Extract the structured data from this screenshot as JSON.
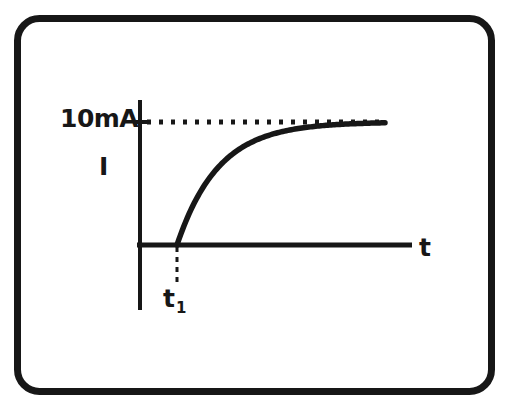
{
  "figure": {
    "border": {
      "name": "rounded-rectangle-frame",
      "color": "#171717",
      "thickness_px": 7,
      "corner_radius_px": 22,
      "x": 14,
      "y": 15,
      "width": 481,
      "height": 380
    },
    "background_color": "#ffffff",
    "ink_color": "#171717"
  },
  "labels": {
    "y_value": "10mA",
    "y_quantity": "I",
    "x_axis": "t",
    "event_time_base": "t",
    "event_time_sub": "1",
    "event_time": "t1"
  },
  "chart_data": {
    "type": "line",
    "title": "",
    "subtitle": "",
    "xlabel": "t",
    "ylabel": "I",
    "grid": false,
    "legend": false,
    "xlim": [
      0,
      10
    ],
    "ylim": [
      0,
      12
    ],
    "yticks": [
      10
    ],
    "ytick_labels": [
      "10mA"
    ],
    "xticks": [
      2.2
    ],
    "xtick_labels": [
      "t1"
    ],
    "annotations": [
      {
        "name": "asymptote-dotted-line",
        "style": "dotted",
        "y": 10,
        "x_start": 0.05,
        "x_end": 9.0,
        "label": "10mA"
      },
      {
        "name": "event-time-dashed-drop-line",
        "style": "dashed",
        "x": 2.2,
        "y_start": 0,
        "y_end": -1.9,
        "label": "t1"
      }
    ],
    "series": [
      {
        "name": "current",
        "style": "solid",
        "equation": "I = 10 * (1 - exp(-(t - t1)/tau)) for t >= t1, else 0",
        "t1": 2.2,
        "tau": 1.35,
        "asymptote": 10,
        "x": [
          2.2,
          2.4,
          2.6,
          2.9,
          3.2,
          3.6,
          4.0,
          4.5,
          5.0,
          5.6,
          6.2,
          7.0,
          7.8,
          8.6,
          9.0
        ],
        "y": [
          0.0,
          1.38,
          2.58,
          4.11,
          5.31,
          6.58,
          7.49,
          8.3,
          8.86,
          9.32,
          9.6,
          9.83,
          9.93,
          9.97,
          9.98
        ]
      }
    ]
  },
  "geometry": {
    "y_axis": {
      "x": 140,
      "y_top": 100,
      "y_bottom": 310
    },
    "x_axis": {
      "y": 245,
      "x_start": 137,
      "x_end": 412
    },
    "tick_10ma": {
      "x_start": 133,
      "x_end": 150,
      "y": 122
    },
    "dotted_line": {
      "y": 122,
      "x_start": 147,
      "x_end": 385
    },
    "curve_origin": {
      "x": 177,
      "y": 245
    },
    "curve_end": {
      "x": 385,
      "y": 122
    },
    "drop_line": {
      "x": 177,
      "y_start": 247,
      "y_end": 284
    }
  }
}
